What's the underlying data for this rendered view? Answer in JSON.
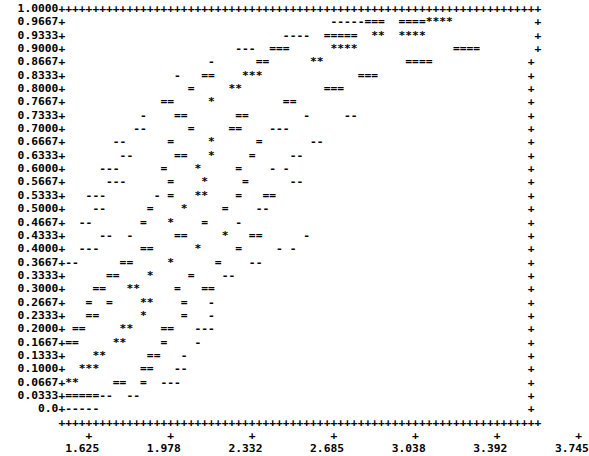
{
  "figure": {
    "kind": "ascii-scatter-plot",
    "glyph_legend": {
      "border": "+",
      "density_low": "-",
      "density_mid": "=",
      "density_high": "*"
    },
    "font_color": "#000000",
    "background_color": "#ffffff"
  },
  "chart_data": {
    "type": "scatter",
    "title": "",
    "subtitle": "",
    "xlabel": "",
    "ylabel": "",
    "grid": false,
    "legend": "none",
    "xlim": [
      1.625,
      3.745
    ],
    "ylim": [
      0.0,
      1.0
    ],
    "xtick_labels": [
      "1.625",
      "1.978",
      "2.332",
      "2.685",
      "3.038",
      "3.392",
      "3.745"
    ],
    "xticks": [
      1.625,
      1.978,
      2.332,
      2.685,
      3.038,
      3.392,
      3.745
    ],
    "ytick_labels": [
      "1.0000",
      "0.9667",
      "0.9333",
      "0.9000",
      "0.8667",
      "0.8333",
      "0.8000",
      "0.7667",
      "0.7333",
      "0.7000",
      "0.6667",
      "0.6333",
      "0.6000",
      "0.5667",
      "0.5333",
      "0.5000",
      "0.4667",
      "0.4333",
      "0.4000",
      "0.3667",
      "0.3333",
      "0.3000",
      "0.2667",
      "0.2333",
      "0.2000",
      "0.1667",
      "0.1333",
      "0.1000",
      "0.0667",
      "0.0333",
      "0.0"
    ],
    "yticks": [
      1.0,
      0.9667,
      0.9333,
      0.9,
      0.8667,
      0.8333,
      0.8,
      0.7667,
      0.7333,
      0.7,
      0.6667,
      0.6333,
      0.6,
      0.5667,
      0.5333,
      0.5,
      0.4667,
      0.4333,
      0.4,
      0.3667,
      0.3333,
      0.3,
      0.2667,
      0.2333,
      0.2,
      0.1667,
      0.1333,
      0.1,
      0.0667,
      0.0333,
      0.0
    ],
    "plot_cols": 71,
    "plot_rows": 31,
    "rows": [
      "+++++++++++++++++++++++++++++++++++++++++++++++++++++++++++++++++++++++",
      "+                                       -----===  ====****            +",
      "+                                ----  =====  **  ****                +",
      "+                         ---  ===      ****              ====        +",
      "+                     -      ==      **            ====              +",
      "+                -   ==    ***              ===                      +",
      "+                  =     **            ===                           +",
      "+              ==     *          ==                                  +",
      "+           -    ==       ==        -     --                         +",
      "+          --      =     ==    ---                                   +",
      "+       --      =     *      =       --                              +",
      "+        --      ==   *     =     --                                 +",
      "+     ---      =    *     =    - -                                   +",
      "+      ---      =    *     =      --                                 +",
      "+   ---       - =   **    =   ==                                     +",
      "+    --      =    *     =    --                                      +",
      "+  --       =   *    =    -                                          +",
      "+     --  -      ==     *   ==      -                                +",
      "+  ---      ==      *     =     - -                                  +",
      "+--      ==     *      =    --                                       +",
      "+      ==    *     =    --                                           +",
      "+    ==   **     =   ==                                              +",
      "+   =  =    **    =   -                                              +",
      "+   ==      *     =   -                                              +",
      "+ ==     **    ==   ---                                              +",
      "+==     **     =    -                                                +",
      "+    **      ==   -                                                  +",
      "+  ***      ==   --                                                  +",
      "+**     ==  =  ---                                                   +",
      "+=====--  --                                                         +",
      "+-----                                                               +"
    ],
    "bottom_axis": "+++++++++++++++++++++++++++++++++++++++++++++++++++++++++++++++++++++++",
    "tick_row": "    +           +           +           +           +           +           +",
    "label_row": " 1.625       1.978       2.332       2.685       3.038       3.392       3.745"
  }
}
